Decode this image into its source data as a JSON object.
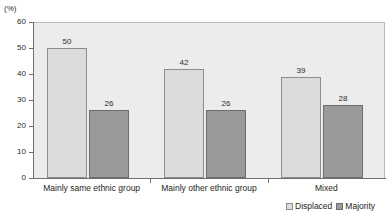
{
  "axis": {
    "unit_caption": "(%)"
  },
  "legend": {
    "position": "bottom-right",
    "items": [
      {
        "label": "Displaced",
        "color": "#dcdcdc",
        "swatch": "legend-swatch-displaced"
      },
      {
        "label": "Majority",
        "color": "#9a9a9a",
        "swatch": "legend-swatch-majority"
      }
    ]
  },
  "chart_data": {
    "type": "bar",
    "title": "",
    "subtitle": "",
    "xlabel": "",
    "ylabel": "(%)",
    "ylim": [
      0,
      60
    ],
    "yticks": [
      0,
      10,
      20,
      30,
      40,
      50,
      60
    ],
    "ytick_labels": [
      "0",
      "10",
      "20",
      "30",
      "40",
      "50",
      "60"
    ],
    "grid": false,
    "legend_position": "bottom-right",
    "categories": [
      "Mainly same ethnic group",
      "Mainly other ethnic group",
      "Mixed"
    ],
    "series": [
      {
        "name": "Displaced",
        "color": "#dcdcdc",
        "values": [
          50,
          42,
          39
        ],
        "value_labels": [
          "50",
          "42",
          "39"
        ]
      },
      {
        "name": "Majority",
        "color": "#9a9a9a",
        "values": [
          26,
          26,
          28
        ],
        "value_labels": [
          "26",
          "26",
          "28"
        ]
      }
    ]
  }
}
